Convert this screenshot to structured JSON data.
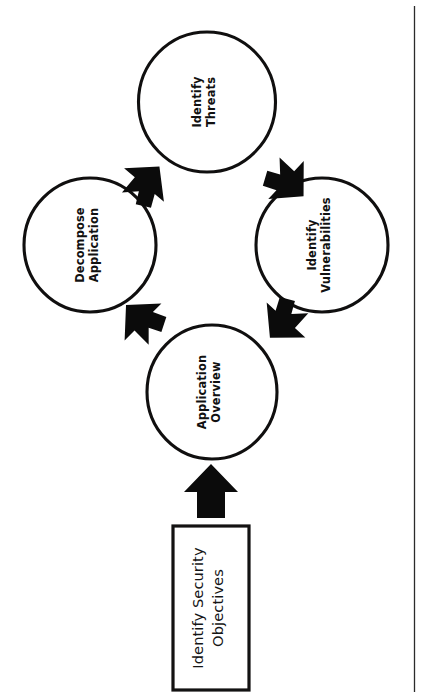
{
  "page": {
    "background_color": "#ffffff",
    "ink_color": "#111111",
    "rotation_note": "All text rendered rotated 90 degrees counter-clockwise (reads bottom-to-top)",
    "border_line_color": "#2b2b2b"
  },
  "nodes": {
    "step_objectives": {
      "shape": "rectangle",
      "line1": "Identify Security",
      "line2": "Objectives",
      "full_label": "Identify Security Objectives",
      "bold": false
    },
    "step_overview": {
      "shape": "circle",
      "line1": "Application",
      "line2": "Overview",
      "full_label": "Application Overview",
      "bold": true
    },
    "step_decompose": {
      "shape": "circle",
      "line1": "Decompose",
      "line2": "Application",
      "full_label": "Decompose Application",
      "bold": true
    },
    "step_threats": {
      "shape": "circle",
      "line1": "Identify",
      "line2": "Threats",
      "full_label": "Identify Threats",
      "bold": true
    },
    "step_vulnerabilities": {
      "shape": "circle",
      "line1": "Identify",
      "line2": "Vulnerabilities",
      "full_label": "Identify Vulnerabilities",
      "bold": true
    }
  },
  "arrows": [
    {
      "name": "arrow-objectives-to-overview",
      "style": "straight",
      "from": "Identify Security Objectives",
      "to": "Application Overview",
      "direction": "up"
    },
    {
      "name": "arrow-overview-to-decompose",
      "style": "chevron",
      "from": "Application Overview",
      "to": "Decompose Application",
      "direction": "up-left"
    },
    {
      "name": "arrow-decompose-to-threats",
      "style": "chevron",
      "from": "Decompose Application",
      "to": "Identify Threats",
      "direction": "up-right"
    },
    {
      "name": "arrow-threats-to-vulnerabilities",
      "style": "chevron",
      "from": "Identify Threats",
      "to": "Identify Vulnerabilities",
      "direction": "down-right"
    },
    {
      "name": "arrow-vulnerabilities-to-overview",
      "style": "chevron",
      "from": "Identify Vulnerabilities",
      "to": "Application Overview",
      "direction": "down-left"
    }
  ]
}
